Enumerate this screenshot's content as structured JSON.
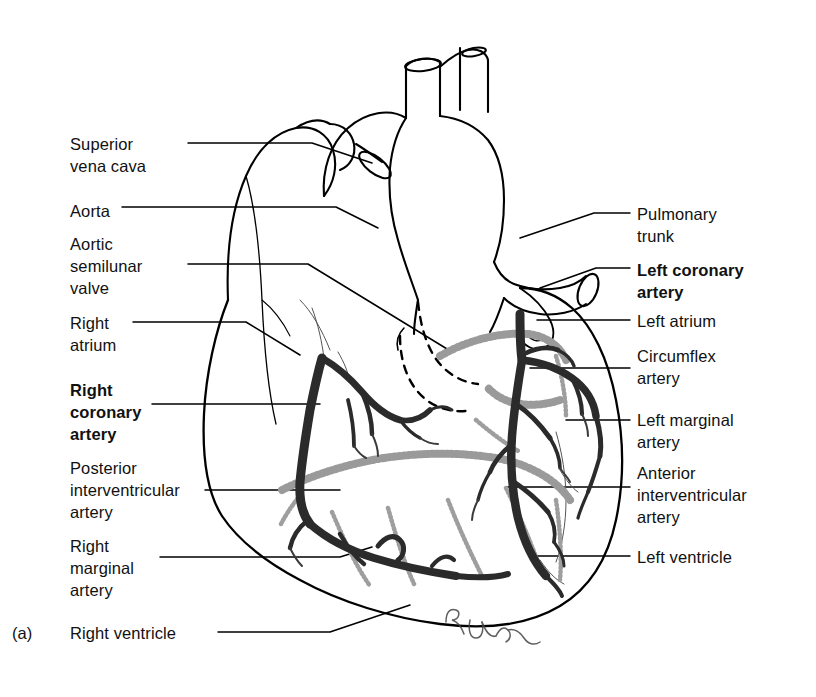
{
  "figure": {
    "caption": "(a)",
    "signature": "R. Jenn"
  },
  "colors": {
    "outline": "#000000",
    "artery": "#2b2b2b",
    "vein": "#8f8f8f",
    "text": "#111111",
    "background": "#ffffff"
  },
  "labels_left": [
    {
      "id": "superior-vena-cava",
      "text": "Superior\nvena cava",
      "bold": false,
      "x": 70,
      "y": 133
    },
    {
      "id": "aorta",
      "text": "Aorta",
      "bold": false,
      "x": 70,
      "y": 200
    },
    {
      "id": "aortic-semilunar-valve",
      "text": "Aortic\nsemilunar\nvalve",
      "bold": false,
      "x": 70,
      "y": 233
    },
    {
      "id": "right-atrium",
      "text": "Right\natrium",
      "bold": false,
      "x": 70,
      "y": 312
    },
    {
      "id": "right-coronary-artery",
      "text": "Right\ncoronary\nartery",
      "bold": true,
      "x": 70,
      "y": 379
    },
    {
      "id": "posterior-interventricular-artery",
      "text": "Posterior\ninterventricular\nartery",
      "bold": false,
      "x": 70,
      "y": 457
    },
    {
      "id": "right-marginal-artery",
      "text": "Right\nmarginal\nartery",
      "bold": false,
      "x": 70,
      "y": 535
    },
    {
      "id": "right-ventricle",
      "text": "Right ventricle",
      "bold": false,
      "x": 70,
      "y": 622
    }
  ],
  "labels_right": [
    {
      "id": "pulmonary-trunk",
      "text": "Pulmonary\ntrunk",
      "bold": false,
      "x": 637,
      "y": 203
    },
    {
      "id": "left-coronary-artery",
      "text": "Left coronary\nartery",
      "bold": true,
      "x": 637,
      "y": 259
    },
    {
      "id": "left-atrium",
      "text": "Left atrium",
      "bold": false,
      "x": 637,
      "y": 310
    },
    {
      "id": "circumflex-artery",
      "text": "Circumflex\nartery",
      "bold": false,
      "x": 637,
      "y": 345
    },
    {
      "id": "left-marginal-artery",
      "text": "Left marginal\nartery",
      "bold": false,
      "x": 637,
      "y": 409
    },
    {
      "id": "anterior-interventricular-artery",
      "text": "Anterior\ninterventricular\nartery",
      "bold": false,
      "x": 637,
      "y": 462
    },
    {
      "id": "left-ventricle",
      "text": "Left ventricle",
      "bold": false,
      "x": 637,
      "y": 546
    }
  ]
}
